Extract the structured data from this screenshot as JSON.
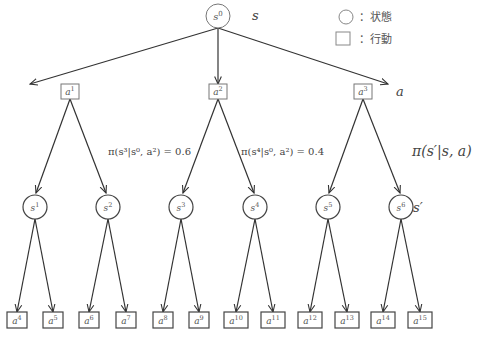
{
  "legend": {
    "state": {
      "shape": "circle",
      "label": "：状態"
    },
    "action": {
      "shape": "square",
      "label": "：行動"
    }
  },
  "side_labels": {
    "state": "s",
    "action": "a",
    "transition": "π(s′|s, a)",
    "next_state": "s′"
  },
  "edge_labels": {
    "s3": "π(s³|s⁰, a²) = 0.6",
    "s4": "π(s⁴|s⁰, a²) = 0.4"
  },
  "nodes": {
    "root": {
      "base": "s",
      "sup": "0"
    },
    "actions_l1": [
      {
        "base": "a",
        "sup": "1"
      },
      {
        "base": "a",
        "sup": "2"
      },
      {
        "base": "a",
        "sup": "3"
      }
    ],
    "states_l2": [
      {
        "base": "s",
        "sup": "1"
      },
      {
        "base": "s",
        "sup": "2"
      },
      {
        "base": "s",
        "sup": "3"
      },
      {
        "base": "s",
        "sup": "4"
      },
      {
        "base": "s",
        "sup": "5"
      },
      {
        "base": "s",
        "sup": "6"
      }
    ],
    "actions_l3": [
      {
        "base": "a",
        "sup": "4"
      },
      {
        "base": "a",
        "sup": "5"
      },
      {
        "base": "a",
        "sup": "6"
      },
      {
        "base": "a",
        "sup": "7"
      },
      {
        "base": "a",
        "sup": "8"
      },
      {
        "base": "a",
        "sup": "9"
      },
      {
        "base": "a",
        "sup": "10"
      },
      {
        "base": "a",
        "sup": "11"
      },
      {
        "base": "a",
        "sup": "12"
      },
      {
        "base": "a",
        "sup": "13"
      },
      {
        "base": "a",
        "sup": "14"
      },
      {
        "base": "a",
        "sup": "15"
      }
    ]
  }
}
